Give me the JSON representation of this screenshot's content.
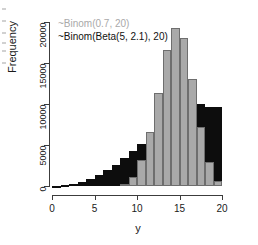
{
  "chart_data": {
    "type": "bar",
    "subtype": "overlaid-histogram",
    "title": "",
    "xlabel": "y",
    "ylabel": "Frequency",
    "xlim": [
      0,
      20
    ],
    "ylim": [
      0,
      20000
    ],
    "xticks": [
      0,
      5,
      10,
      15,
      20
    ],
    "xtick_labels": [
      "0",
      "5",
      "10",
      "15",
      "20"
    ],
    "yticks": [
      0,
      5000,
      10000,
      15000,
      20000
    ],
    "ytick_labels": [
      "0",
      "5000",
      "10000",
      "15000",
      "20000"
    ],
    "grid": false,
    "legend_position": "top-left",
    "bin_width": 1,
    "categories": [
      0,
      1,
      2,
      3,
      4,
      5,
      6,
      7,
      8,
      9,
      10,
      11,
      12,
      13,
      14,
      15,
      16,
      17,
      18,
      19
    ],
    "series": [
      {
        "name": "~Binom(Beta(5, 2.1), 20)",
        "color": "#0d0d0d",
        "values": [
          60,
          120,
          260,
          480,
          820,
          1300,
          1900,
          2600,
          3450,
          4300,
          5100,
          5900,
          6600,
          7700,
          9000,
          10400,
          10800,
          10000,
          9600,
          9600
        ]
      },
      {
        "name": "~Binom(0.7, 20)",
        "color": "#a9a9a9",
        "values": [
          0,
          0,
          0,
          0,
          0,
          0,
          0,
          0,
          300,
          1100,
          3150,
          6550,
          11400,
          16600,
          19250,
          18050,
          13000,
          7200,
          2900,
          600
        ]
      }
    ],
    "legend": [
      {
        "label": "~Binom(0.7, 20)",
        "color": "#a9a9a9"
      },
      {
        "label": "~Binom(Beta(5, 2.1), 20)",
        "color": "#111111"
      }
    ]
  },
  "axes": {
    "x_title": "y",
    "y_title": "Frequency"
  },
  "legend": {
    "entry_gray": "~Binom(0.7, 20)",
    "entry_black": "~Binom(Beta(5, 2.1), 20)"
  }
}
